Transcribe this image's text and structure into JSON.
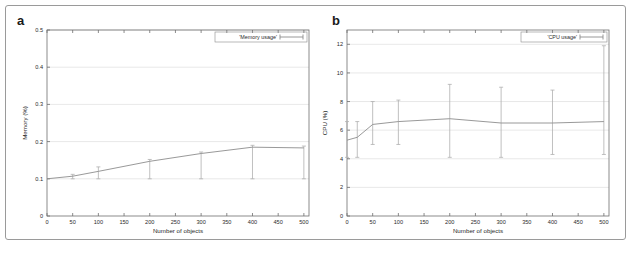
{
  "figure": {
    "panels": [
      {
        "letter": "a",
        "legend_label": "'Memory usage'"
      },
      {
        "letter": "b",
        "legend_label": "'CPU usage'"
      }
    ]
  },
  "chart_data": [
    {
      "type": "line",
      "panel": "a",
      "title": "",
      "legend": [
        "'Memory usage'"
      ],
      "legend_position": "top-right",
      "grid": true,
      "xlabel": "Number of objects",
      "ylabel": "Memory (%)",
      "xlim": [
        0,
        510
      ],
      "ylim": [
        0,
        0.5
      ],
      "xticks": [
        0,
        50,
        100,
        150,
        200,
        250,
        300,
        350,
        400,
        450,
        500
      ],
      "xtick_labels": [
        "0",
        "50",
        "100",
        "150",
        "200",
        "250",
        "300",
        "350",
        "400",
        "450",
        "500"
      ],
      "yticks": [
        0,
        0.1,
        0.2,
        0.3,
        0.4,
        0.5
      ],
      "ytick_labels": [
        "0",
        "0.1",
        "0.2",
        "0.3",
        "0.4",
        "0.5"
      ],
      "x": [
        0,
        50,
        100,
        200,
        300,
        400,
        500
      ],
      "values": [
        0.1,
        0.107,
        0.12,
        0.147,
        0.168,
        0.185,
        0.183
      ],
      "error_low": [
        0.1,
        0.1,
        0.1,
        0.1,
        0.1,
        0.1,
        0.1
      ],
      "error_high": [
        0.1,
        0.112,
        0.132,
        0.152,
        0.172,
        0.19,
        0.188
      ]
    },
    {
      "type": "line",
      "panel": "b",
      "title": "",
      "legend": [
        "'CPU usage'"
      ],
      "legend_position": "top-right",
      "grid": true,
      "xlabel": "Number of objects",
      "ylabel": "CPU (%)",
      "xlim": [
        0,
        510
      ],
      "ylim": [
        0,
        13
      ],
      "xticks": [
        0,
        50,
        100,
        150,
        200,
        250,
        300,
        350,
        400,
        450,
        500
      ],
      "xtick_labels": [
        "0",
        "50",
        "100",
        "150",
        "200",
        "250",
        "300",
        "350",
        "400",
        "450",
        "500"
      ],
      "yticks": [
        0,
        2,
        4,
        6,
        8,
        10,
        12
      ],
      "ytick_labels": [
        "0",
        "2",
        "4",
        "6",
        "8",
        "10",
        "12"
      ],
      "x": [
        0,
        20,
        50,
        100,
        200,
        300,
        400,
        500
      ],
      "values": [
        5.3,
        5.5,
        6.4,
        6.6,
        6.8,
        6.5,
        6.5,
        6.6
      ],
      "error_low": [
        4.1,
        4.1,
        5.0,
        5.0,
        4.1,
        4.1,
        4.3,
        4.3
      ],
      "error_high": [
        6.6,
        6.6,
        8.0,
        8.1,
        9.2,
        9.0,
        8.8,
        11.9
      ]
    }
  ]
}
